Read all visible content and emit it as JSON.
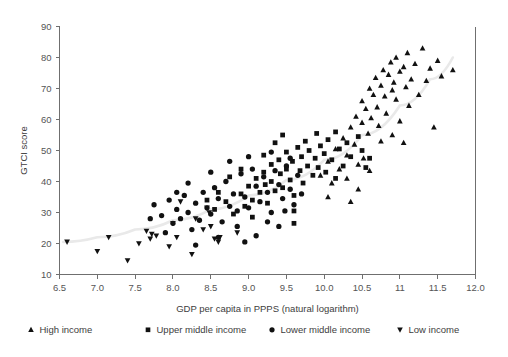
{
  "chart_data": {
    "type": "scatter",
    "title": "",
    "xlabel": "GDP per capita in PPPS (natural logarithm)",
    "ylabel": "GTCI score",
    "xlim": [
      6.5,
      12.0
    ],
    "ylim": [
      10,
      90
    ],
    "xticks": [
      6.5,
      7.0,
      7.5,
      8.0,
      8.5,
      9.0,
      9.5,
      10.0,
      10.5,
      11.0,
      11.5,
      12.0
    ],
    "xtick_labels": [
      "6.5",
      "7.0",
      "7.5",
      "8.0",
      "8.5",
      "9.0",
      "9.5",
      "10.0",
      "10.5",
      "11",
      "11.5",
      "12.0"
    ],
    "yticks": [
      10,
      20,
      30,
      40,
      50,
      60,
      70,
      80,
      90
    ],
    "ytick_labels": [
      "10",
      "20",
      "30",
      "40",
      "50",
      "60",
      "70",
      "80",
      "90"
    ],
    "grid": false,
    "legend_position": "bottom",
    "trendline": {
      "visible": true,
      "color": "#e9e9e9",
      "points": [
        [
          6.55,
          20.5
        ],
        [
          7.0,
          22.0
        ],
        [
          7.5,
          24.5
        ],
        [
          8.0,
          27.5
        ],
        [
          8.5,
          31.0
        ],
        [
          9.0,
          35.5
        ],
        [
          9.5,
          40.5
        ],
        [
          10.0,
          47.0
        ],
        [
          10.5,
          55.0
        ],
        [
          11.0,
          64.5
        ],
        [
          11.4,
          73.0
        ],
        [
          11.7,
          80.0
        ]
      ]
    },
    "series": [
      {
        "name": "High income",
        "marker": "triangle-up",
        "color": "#111111",
        "points": [
          [
            9.95,
            42.0
          ],
          [
            10.05,
            46.5
          ],
          [
            10.1,
            39.5
          ],
          [
            10.15,
            50.5
          ],
          [
            10.2,
            44.0
          ],
          [
            10.25,
            54.0
          ],
          [
            10.3,
            48.5
          ],
          [
            10.3,
            41.0
          ],
          [
            10.35,
            57.5
          ],
          [
            10.4,
            52.0
          ],
          [
            10.42,
            61.0
          ],
          [
            10.45,
            45.5
          ],
          [
            10.5,
            59.0
          ],
          [
            10.5,
            66.0
          ],
          [
            10.55,
            63.5
          ],
          [
            10.58,
            55.5
          ],
          [
            10.6,
            70.0
          ],
          [
            10.62,
            60.5
          ],
          [
            10.65,
            68.0
          ],
          [
            10.68,
            73.5
          ],
          [
            10.7,
            64.0
          ],
          [
            10.72,
            58.0
          ],
          [
            10.75,
            71.0
          ],
          [
            10.78,
            76.0
          ],
          [
            10.8,
            67.5
          ],
          [
            10.82,
            62.0
          ],
          [
            10.85,
            74.5
          ],
          [
            10.88,
            78.5
          ],
          [
            10.9,
            69.5
          ],
          [
            10.92,
            72.0
          ],
          [
            10.95,
            80.0
          ],
          [
            10.95,
            66.5
          ],
          [
            11.0,
            75.5
          ],
          [
            11.0,
            59.5
          ],
          [
            11.05,
            77.0
          ],
          [
            11.08,
            70.5
          ],
          [
            11.1,
            81.5
          ],
          [
            11.12,
            64.5
          ],
          [
            11.15,
            73.0
          ],
          [
            11.2,
            78.0
          ],
          [
            11.25,
            68.0
          ],
          [
            11.3,
            83.0
          ],
          [
            11.35,
            72.5
          ],
          [
            11.4,
            76.5
          ],
          [
            11.45,
            57.5
          ],
          [
            11.5,
            79.0
          ],
          [
            11.55,
            74.0
          ],
          [
            11.7,
            76.0
          ],
          [
            10.05,
            35.0
          ],
          [
            10.45,
            37.5
          ],
          [
            10.6,
            43.5
          ],
          [
            10.9,
            55.0
          ],
          [
            11.05,
            52.5
          ],
          [
            10.35,
            33.5
          ],
          [
            10.52,
            47.5
          ],
          [
            10.75,
            53.0
          ]
        ]
      },
      {
        "name": "Upper middle income",
        "marker": "square",
        "color": "#111111",
        "points": [
          [
            8.55,
            31.0
          ],
          [
            8.7,
            33.5
          ],
          [
            8.8,
            29.5
          ],
          [
            8.9,
            36.0
          ],
          [
            8.95,
            32.0
          ],
          [
            9.0,
            38.5
          ],
          [
            9.05,
            34.0
          ],
          [
            9.1,
            41.0
          ],
          [
            9.15,
            36.5
          ],
          [
            9.2,
            43.0
          ],
          [
            9.22,
            39.0
          ],
          [
            9.25,
            33.0
          ],
          [
            9.3,
            45.5
          ],
          [
            9.3,
            40.0
          ],
          [
            9.35,
            37.0
          ],
          [
            9.4,
            47.0
          ],
          [
            9.42,
            42.5
          ],
          [
            9.45,
            38.0
          ],
          [
            9.5,
            49.5
          ],
          [
            9.5,
            44.0
          ],
          [
            9.55,
            40.5
          ],
          [
            9.58,
            46.5
          ],
          [
            9.6,
            35.5
          ],
          [
            9.65,
            51.0
          ],
          [
            9.68,
            43.5
          ],
          [
            9.7,
            48.0
          ],
          [
            9.72,
            39.5
          ],
          [
            9.75,
            53.0
          ],
          [
            9.78,
            45.0
          ],
          [
            9.8,
            50.0
          ],
          [
            9.85,
            42.0
          ],
          [
            9.88,
            47.5
          ],
          [
            9.9,
            55.5
          ],
          [
            9.92,
            44.5
          ],
          [
            9.95,
            51.5
          ],
          [
            10.0,
            49.0
          ],
          [
            10.02,
            43.0
          ],
          [
            10.05,
            53.5
          ],
          [
            10.1,
            47.0
          ],
          [
            10.15,
            56.0
          ],
          [
            10.2,
            50.5
          ],
          [
            10.25,
            45.0
          ],
          [
            10.3,
            52.5
          ],
          [
            10.35,
            48.0
          ],
          [
            10.45,
            54.5
          ],
          [
            10.5,
            50.0
          ],
          [
            10.55,
            44.5
          ],
          [
            9.35,
            52.5
          ],
          [
            9.6,
            30.5
          ],
          [
            8.6,
            36.5
          ],
          [
            8.45,
            34.0
          ],
          [
            9.05,
            28.5
          ],
          [
            9.45,
            55.0
          ],
          [
            10.15,
            41.0
          ],
          [
            10.6,
            47.5
          ],
          [
            9.2,
            48.5
          ],
          [
            8.75,
            41.5
          ],
          [
            8.9,
            44.0
          ],
          [
            9.6,
            26.5
          ]
        ]
      },
      {
        "name": "Lower middle income",
        "marker": "circle",
        "color": "#111111",
        "points": [
          [
            7.75,
            32.5
          ],
          [
            7.85,
            29.0
          ],
          [
            7.95,
            34.0
          ],
          [
            8.0,
            26.5
          ],
          [
            8.05,
            31.0
          ],
          [
            8.1,
            28.0
          ],
          [
            8.15,
            35.5
          ],
          [
            8.2,
            30.0
          ],
          [
            8.25,
            24.5
          ],
          [
            8.3,
            33.0
          ],
          [
            8.35,
            27.5
          ],
          [
            8.4,
            36.5
          ],
          [
            8.45,
            31.5
          ],
          [
            8.5,
            29.5
          ],
          [
            8.55,
            38.0
          ],
          [
            8.6,
            34.5
          ],
          [
            8.65,
            27.0
          ],
          [
            8.7,
            40.0
          ],
          [
            8.75,
            32.0
          ],
          [
            8.8,
            36.0
          ],
          [
            8.85,
            30.5
          ],
          [
            8.9,
            42.5
          ],
          [
            8.95,
            35.0
          ],
          [
            9.0,
            31.5
          ],
          [
            9.05,
            44.0
          ],
          [
            9.1,
            38.5
          ],
          [
            9.15,
            33.5
          ],
          [
            9.2,
            41.5
          ],
          [
            9.25,
            36.5
          ],
          [
            9.3,
            30.0
          ],
          [
            9.35,
            43.5
          ],
          [
            9.4,
            39.0
          ],
          [
            9.45,
            34.5
          ],
          [
            9.5,
            45.0
          ],
          [
            9.55,
            37.5
          ],
          [
            9.6,
            32.5
          ],
          [
            9.65,
            42.0
          ],
          [
            9.7,
            36.0
          ],
          [
            8.3,
            19.5
          ],
          [
            9.1,
            22.5
          ],
          [
            8.85,
            25.5
          ],
          [
            7.9,
            23.5
          ],
          [
            8.2,
            39.5
          ],
          [
            8.5,
            43.0
          ],
          [
            8.75,
            46.5
          ],
          [
            9.0,
            48.0
          ],
          [
            9.25,
            27.0
          ],
          [
            9.4,
            25.5
          ],
          [
            9.55,
            47.5
          ],
          [
            8.6,
            22.0
          ],
          [
            8.05,
            36.5
          ],
          [
            9.3,
            49.5
          ],
          [
            7.7,
            28.0
          ],
          [
            8.95,
            20.5
          ],
          [
            9.48,
            30.5
          ]
        ]
      },
      {
        "name": "Low income",
        "marker": "triangle-down",
        "color": "#111111",
        "points": [
          [
            6.6,
            20.5
          ],
          [
            7.0,
            17.5
          ],
          [
            7.15,
            22.0
          ],
          [
            7.4,
            14.5
          ],
          [
            7.55,
            20.0
          ],
          [
            7.65,
            24.0
          ],
          [
            7.7,
            21.5
          ],
          [
            7.72,
            23.0
          ],
          [
            7.78,
            22.5
          ],
          [
            8.0,
            26.5
          ],
          [
            8.05,
            22.0
          ],
          [
            8.25,
            16.5
          ],
          [
            8.45,
            31.5
          ],
          [
            8.48,
            30.0
          ],
          [
            8.5,
            25.5
          ],
          [
            8.55,
            21.5
          ],
          [
            8.6,
            20.5
          ],
          [
            8.62,
            22.0
          ],
          [
            8.85,
            23.5
          ],
          [
            8.3,
            28.0
          ],
          [
            7.95,
            19.0
          ],
          [
            8.4,
            24.5
          ],
          [
            8.1,
            33.5
          ]
        ]
      }
    ]
  },
  "legend": {
    "items": [
      {
        "label": "High income",
        "marker": "triangle-up"
      },
      {
        "label": "Upper middle income",
        "marker": "square"
      },
      {
        "label": "Lower middle income",
        "marker": "circle"
      },
      {
        "label": "Low income",
        "marker": "triangle-down"
      }
    ]
  }
}
